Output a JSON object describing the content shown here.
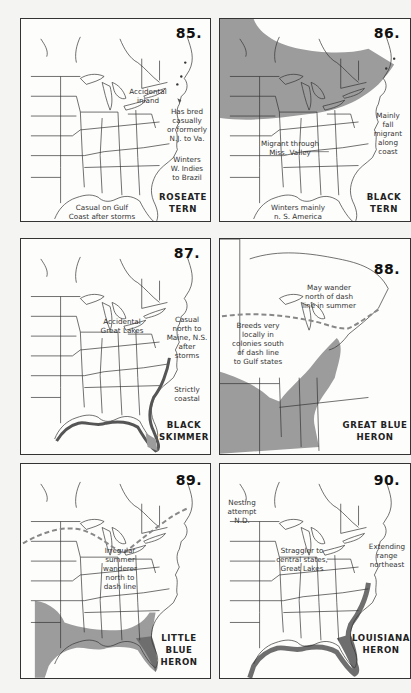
{
  "colors": {
    "range_fill": "#9c9c9c",
    "dense_fill": "#6e6e6e",
    "outline": "#333333",
    "page_bg": "#f4f4f2",
    "panel_bg": "#fdfdfc"
  },
  "panels": [
    {
      "number": "85.",
      "species": "ROSEATE\nTERN",
      "notes": [
        "Accidental\ninland",
        "Has bred\ncasually\nor formerly\nN.J. to Va.",
        "Winters\nW. Indies\nto Brazil",
        "Casual on Gulf\nCoast after storms"
      ]
    },
    {
      "number": "86.",
      "species": "BLACK\nTERN",
      "notes": [
        "Mainly\nfall\nmigrant\nalong\ncoast",
        "Migrant through\nMiss. Valley",
        "Winters mainly\nn. S. America"
      ]
    },
    {
      "number": "87.",
      "species": "BLACK\nSKIMMER",
      "notes": [
        "Accidental\nGreat Lakes",
        "Casual\nnorth to\nMaine, N.S.\nafter\nstorms",
        "Strictly\ncoastal"
      ]
    },
    {
      "number": "88.",
      "species": "GREAT BLUE\nHERON",
      "notes": [
        "May wander\nnorth of dash\nline in summer",
        "Breeds very\nlocally in\ncolonies south\nof dash line\nto Gulf states"
      ]
    },
    {
      "number": "89.",
      "species": "LITTLE BLUE\nHERON",
      "notes": [
        "Irregular\nsummer\nwanderer\nnorth to\ndash line"
      ]
    },
    {
      "number": "90.",
      "species": "LOUISIANA\nHERON",
      "notes": [
        "Nesting\nattempt\nN.D.",
        "Straggler to\ncentral states,\nGreat Lakes",
        "Extending\nrange\nnortheast"
      ]
    }
  ]
}
